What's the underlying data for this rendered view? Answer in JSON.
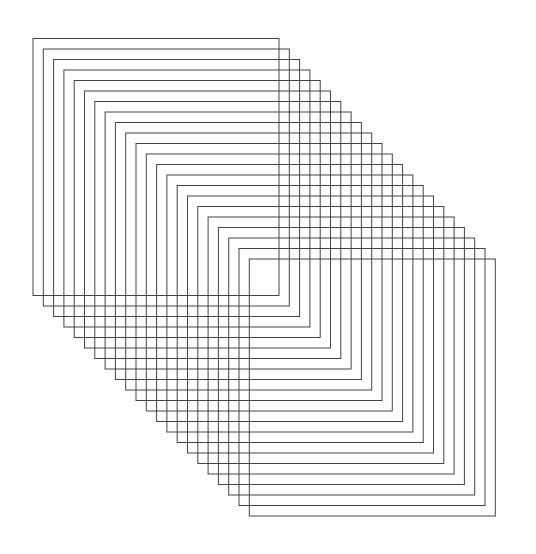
{
  "canvas": {
    "width": 536,
    "height": 554,
    "background": "#ffffff"
  },
  "pattern": {
    "description": "Sequence of equal-size outlined rectangles shifted diagonally",
    "count": 22,
    "first_x": 33,
    "first_y": 38.5,
    "rect_width": 246,
    "rect_height": 257,
    "step_x": 10.3,
    "step_y": 10.5,
    "stroke": "#444444",
    "stroke_width": 1
  }
}
